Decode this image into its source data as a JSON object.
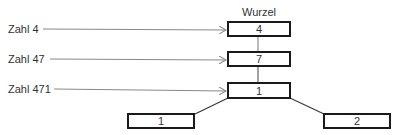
{
  "diagram": {
    "type": "tree",
    "root_label": "Wurzel",
    "pointer_labels": [
      {
        "text": "Zahl 4",
        "points_to": "node-4"
      },
      {
        "text": "Zahl 47",
        "points_to": "node-7"
      },
      {
        "text": "Zahl 471",
        "points_to": "node-1-mid"
      }
    ],
    "nodes": [
      {
        "id": "node-4",
        "value": "4"
      },
      {
        "id": "node-7",
        "value": "7"
      },
      {
        "id": "node-1-mid",
        "value": "1"
      },
      {
        "id": "node-1-left",
        "value": "1"
      },
      {
        "id": "node-2-right",
        "value": "2"
      }
    ],
    "edges": [
      [
        "node-4",
        "node-7"
      ],
      [
        "node-7",
        "node-1-mid"
      ],
      [
        "node-1-mid",
        "node-1-left"
      ],
      [
        "node-1-mid",
        "node-2-right"
      ]
    ],
    "colors": {
      "box_border": "#1a1a1a",
      "edge": "#3a3a3a",
      "arrow": "#888888",
      "text": "#333333"
    }
  }
}
